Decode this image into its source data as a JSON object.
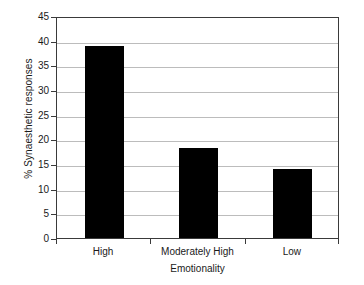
{
  "chart_data": {
    "type": "bar",
    "title": "",
    "xlabel": "Emotionality",
    "ylabel": "% Synaesthetic responses",
    "categories": [
      "High",
      "Moderately High",
      "Low"
    ],
    "values": [
      39,
      18.3,
      14
    ],
    "series": [
      {
        "name": "% Synaesthetic responses",
        "values": [
          39,
          18.3,
          14
        ]
      }
    ],
    "ylim": [
      0,
      45
    ],
    "yticks": [
      0,
      5,
      10,
      15,
      20,
      25,
      30,
      35,
      40,
      45
    ],
    "ytick_labels": [
      "0",
      "5",
      "10",
      "15",
      "20",
      "25",
      "30",
      "35",
      "40",
      "45"
    ],
    "grid": true,
    "grid_axis": "y",
    "legend": false,
    "legend_position": "none",
    "bar_color": "#000000",
    "grid_color": "#bcbcbc",
    "axis_color": "#3a3a3a",
    "background_color": "#ffffff"
  }
}
